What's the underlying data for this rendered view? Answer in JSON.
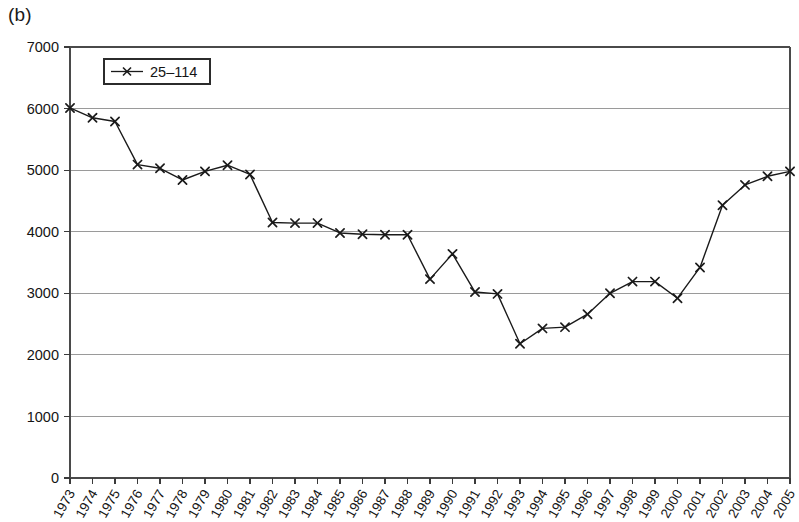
{
  "panel": {
    "label": "(b)"
  },
  "legend": {
    "position": "top-left-inside",
    "entries": [
      {
        "label": "25–114",
        "marker": "x-marker",
        "color": "#1a1a1a"
      }
    ]
  },
  "axes": {
    "y": {
      "min": 0,
      "max": 7000,
      "step": 1000,
      "ticks": [
        "0",
        "1000",
        "2000",
        "3000",
        "4000",
        "5000",
        "6000",
        "7000"
      ]
    },
    "x": {
      "ticks": [
        "1973",
        "1974",
        "1975",
        "1976",
        "1977",
        "1978",
        "1979",
        "1980",
        "1981",
        "1982",
        "1983",
        "1984",
        "1985",
        "1986",
        "1987",
        "1988",
        "1989",
        "1990",
        "1991",
        "1992",
        "1993",
        "1994",
        "1995",
        "1996",
        "1997",
        "1998",
        "1999",
        "2000",
        "2001",
        "2002",
        "2003",
        "2004",
        "2005"
      ],
      "label_rotation": "-60"
    }
  },
  "chart_data": {
    "type": "line",
    "title": "",
    "subtitle": "",
    "xlabel": "",
    "ylabel": "",
    "xlim": [
      1973,
      2005
    ],
    "ylim": [
      0,
      7000
    ],
    "grid": "horizontal",
    "legend_position": "top-left-inside",
    "x": [
      1973,
      1974,
      1975,
      1976,
      1977,
      1978,
      1979,
      1980,
      1981,
      1982,
      1983,
      1984,
      1985,
      1986,
      1987,
      1988,
      1989,
      1990,
      1991,
      1992,
      1993,
      1994,
      1995,
      1996,
      1997,
      1998,
      1999,
      2000,
      2001,
      2002,
      2003,
      2004,
      2005
    ],
    "categories": [
      "1973",
      "1974",
      "1975",
      "1976",
      "1977",
      "1978",
      "1979",
      "1980",
      "1981",
      "1982",
      "1983",
      "1984",
      "1985",
      "1986",
      "1987",
      "1988",
      "1989",
      "1990",
      "1991",
      "1992",
      "1993",
      "1994",
      "1995",
      "1996",
      "1997",
      "1998",
      "1999",
      "2000",
      "2001",
      "2002",
      "2003",
      "2004",
      "2005"
    ],
    "series": [
      {
        "name": "25–114",
        "marker": "x",
        "color": "#1a1a1a",
        "values": [
          6010,
          5850,
          5790,
          5090,
          5030,
          4840,
          4980,
          5080,
          4930,
          4150,
          4140,
          4140,
          3980,
          3960,
          3950,
          3950,
          3230,
          3640,
          3020,
          2990,
          2180,
          2430,
          2450,
          2660,
          3000,
          3190,
          3190,
          2920,
          3420,
          4430,
          4760,
          4900,
          4980
        ]
      }
    ]
  }
}
